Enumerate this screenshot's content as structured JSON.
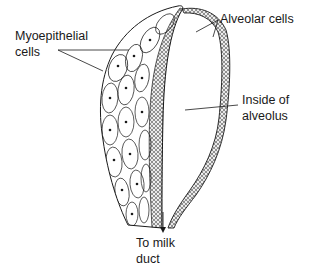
{
  "figure": {
    "labels": {
      "myoepithelial": {
        "line1": "Myoepithelial",
        "line2": "cells"
      },
      "alveolar": {
        "line1": "Alveolar cells"
      },
      "inside": {
        "line1": "Inside of",
        "line2": "alveolus"
      },
      "duct": {
        "line1": "To milk",
        "line2": "duct"
      }
    },
    "colors": {
      "ink": "#1a1a1a",
      "background": "#ffffff"
    }
  }
}
